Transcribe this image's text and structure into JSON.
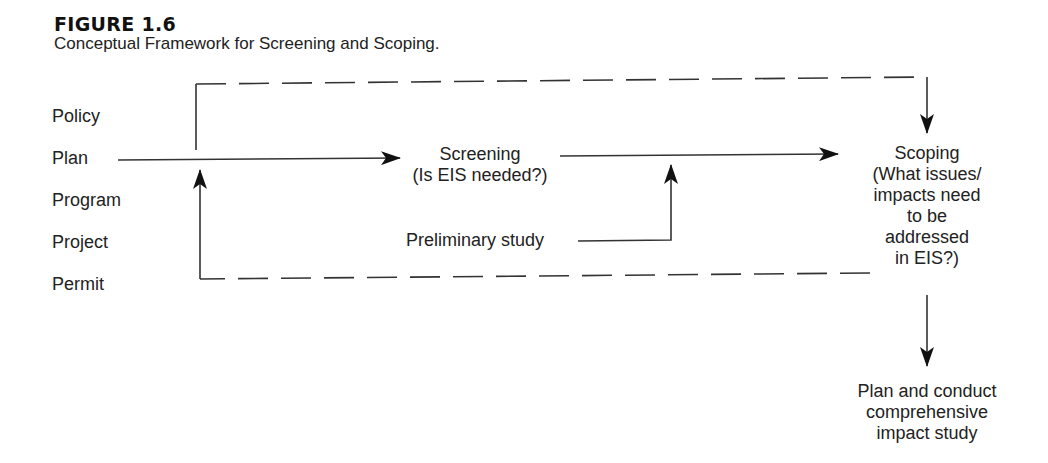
{
  "figure": {
    "number": "FIGURE 1.6",
    "caption": "Conceptual Framework for Screening and Scoping."
  },
  "inputs": [
    "Policy",
    "Plan",
    "Program",
    "Project",
    "Permit"
  ],
  "nodes": {
    "screening": {
      "title": "Screening",
      "question": "(Is EIS needed?)"
    },
    "preliminary": {
      "label": "Preliminary study"
    },
    "scoping": {
      "lines": [
        "Scoping",
        "(What issues/",
        "impacts need",
        "to be",
        "addressed",
        "in EIS?)"
      ]
    },
    "impact_study": {
      "lines": [
        "Plan and conduct",
        "comprehensive",
        "impact study"
      ]
    }
  }
}
